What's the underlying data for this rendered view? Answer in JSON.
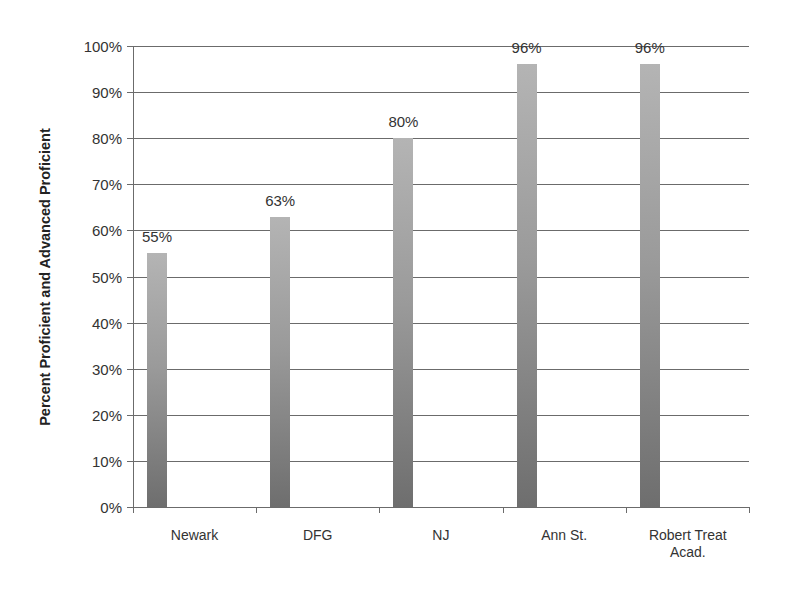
{
  "chart_data": {
    "type": "bar",
    "title": "",
    "xlabel": "",
    "ylabel": "Percent Proficient and Advanced Proficient",
    "categories": [
      "Newark",
      "DFG",
      "NJ",
      "Ann St.",
      "Robert Treat Acad."
    ],
    "values": [
      55,
      63,
      80,
      96,
      96
    ],
    "value_labels": [
      "55%",
      "63%",
      "80%",
      "96%",
      "96%"
    ],
    "ylim": [
      0,
      100
    ],
    "yticks": [
      "0%",
      "10%",
      "20%",
      "30%",
      "40%",
      "50%",
      "60%",
      "70%",
      "80%",
      "90%",
      "100%"
    ],
    "grid": true,
    "legend": null,
    "colors": {
      "bar_top": "#b4b4b4",
      "bar_bottom": "#6e6e6e",
      "grid": "#6b6b6b"
    }
  }
}
